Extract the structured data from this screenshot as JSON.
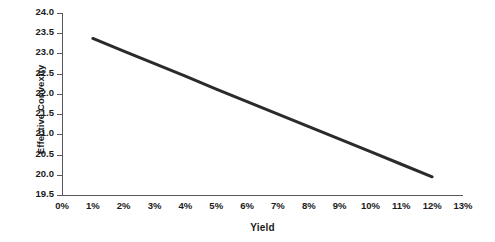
{
  "chart_data": {
    "type": "line",
    "title": "",
    "xlabel": "Yield",
    "ylabel": "Effective Convexity",
    "xlim": [
      0,
      13
    ],
    "ylim": [
      19.5,
      24.0
    ],
    "grid": false,
    "legend": null,
    "x_tick_labels": [
      "0%",
      "1%",
      "2%",
      "3%",
      "4%",
      "5%",
      "6%",
      "7%",
      "8%",
      "9%",
      "10%",
      "11%",
      "12%",
      "13%"
    ],
    "x_tick_values": [
      0,
      1,
      2,
      3,
      4,
      5,
      6,
      7,
      8,
      9,
      10,
      11,
      12,
      13
    ],
    "y_tick_labels": [
      "19.5",
      "20.0",
      "20.5",
      "21.0",
      "21.5",
      "22.0",
      "22.5",
      "23.0",
      "23.5",
      "24.0"
    ],
    "y_tick_values": [
      19.5,
      20.0,
      20.5,
      21.0,
      21.5,
      22.0,
      22.5,
      23.0,
      23.5,
      24.0
    ],
    "series": [
      {
        "name": "Effective Convexity",
        "color": "#2b2b2b",
        "line_width": 3,
        "x": [
          1,
          2,
          3,
          4,
          5,
          6,
          7,
          8,
          9,
          10,
          11,
          12
        ],
        "values": [
          23.37,
          23.06,
          22.75,
          22.44,
          22.12,
          21.81,
          21.5,
          21.19,
          20.88,
          20.57,
          20.26,
          19.95
        ]
      }
    ]
  },
  "axes": {
    "y_title": "Effective Convexity",
    "x_title": "Yield"
  },
  "style": {
    "background": "#ffffff",
    "axis_color": "#55585c",
    "text_color": "#1a1a1a",
    "series_color": "#2b2b2b"
  }
}
